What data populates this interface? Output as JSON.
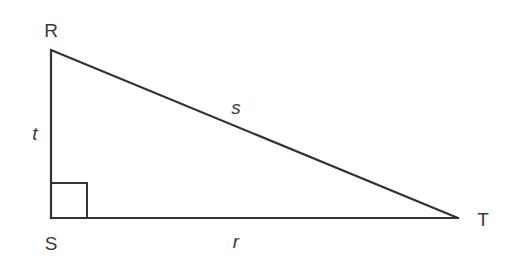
{
  "diagram": {
    "type": "right-triangle",
    "stroke_color": "#333333",
    "vertices": [
      {
        "id": "R",
        "label": "R",
        "x": 51,
        "y": 50
      },
      {
        "id": "S",
        "label": "S",
        "x": 51,
        "y": 218
      },
      {
        "id": "T",
        "label": "T",
        "x": 458,
        "y": 218
      }
    ],
    "sides": [
      {
        "id": "t",
        "label": "t",
        "from": "R",
        "to": "S"
      },
      {
        "id": "s",
        "label": "s",
        "from": "R",
        "to": "T"
      },
      {
        "id": "r",
        "label": "r",
        "from": "S",
        "to": "T"
      }
    ],
    "right_angle_at": "S"
  }
}
